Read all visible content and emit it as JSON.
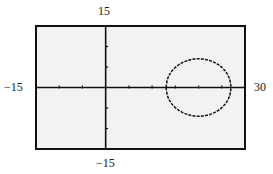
{
  "chart_data": {
    "type": "line",
    "title": "",
    "xlabel": "",
    "ylabel": "",
    "xlim": [
      -15,
      30
    ],
    "ylim": [
      -15,
      15
    ],
    "x_tick_step": 5,
    "y_tick_step": 5,
    "grid": false,
    "tick_labels": {
      "xmin": "−15",
      "xmax": "30",
      "ymax": "15",
      "ymin": "−15"
    },
    "series": [
      {
        "name": "upper-semicircle",
        "center": [
          20,
          0
        ],
        "radius": 7,
        "branch": "y = sqrt(49 - (x-20)^2)",
        "x_range": [
          13,
          27
        ]
      },
      {
        "name": "lower-semicircle",
        "center": [
          20,
          0
        ],
        "radius": 7,
        "branch": "y = -sqrt(49 - (x-20)^2)",
        "x_range": [
          13,
          27
        ]
      }
    ],
    "colors": {
      "screen_bg": "#f2f2f2",
      "frame": "#111111",
      "curve": "#111111"
    }
  }
}
